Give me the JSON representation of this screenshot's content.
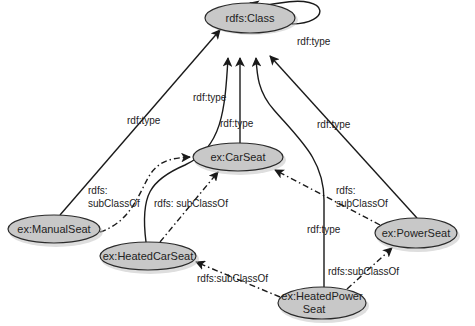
{
  "diagram": {
    "nodes": {
      "rdfs_class": {
        "label": "rdfs:Class"
      },
      "car_seat": {
        "label": "ex:CarSeat"
      },
      "manual_seat": {
        "label": "ex:ManualSeat"
      },
      "heated_car_seat": {
        "label": "ex:HeatedCarSeat"
      },
      "power_seat": {
        "label": "ex:PowerSeat"
      },
      "heated_power_seat": {
        "label_line1": "ex:HeatedPower",
        "label_line2": "Seat"
      }
    },
    "edges": {
      "class_self_type": {
        "label": "rdf:type"
      },
      "manual_seat_type": {
        "label": "rdf:type"
      },
      "heated_car_seat_type": {
        "label": "rdf:type"
      },
      "car_seat_type": {
        "label": "rdf:type"
      },
      "power_seat_type": {
        "label": "rdf:type"
      },
      "heated_power_seat_type": {
        "label": "rdf:type"
      },
      "manual_seat_subclass": {
        "label_line1": "rdfs:",
        "label_line2": "subClassOf"
      },
      "heated_car_seat_subclass": {
        "label": "rdfs: subClassOf"
      },
      "power_seat_subclass": {
        "label_line1": "rdfs:",
        "label_line2": "subClassOf"
      },
      "heated_power_to_heated_car": {
        "label": "rdfs:subClassOf"
      },
      "heated_power_to_power": {
        "label": "rdfs:subClassOf"
      }
    }
  }
}
